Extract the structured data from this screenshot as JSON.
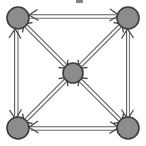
{
  "diagram": {
    "type": "directed-graph",
    "canvas": {
      "width": 146,
      "height": 146,
      "background": "#ffffff"
    },
    "style": {
      "node_fill": "#8c8c8c",
      "node_stroke": "#3c3c3c",
      "edge_color": "#5a5a5a",
      "edge_highlight": "#9a9a9a",
      "arrow_color": "#4a4a4a",
      "artifact_color": "#6e6e6e",
      "edge_rendering": "double-line",
      "edge_width": 1.1,
      "edge_gap": 2.2,
      "arrow_length": 7.5,
      "arrow_spread": 26
    },
    "nodes": [
      {
        "id": "n-top-left",
        "label": "",
        "cx": 18,
        "cy": 18,
        "r": 11.0
      },
      {
        "id": "n-top-right",
        "label": "",
        "cx": 128,
        "cy": 18,
        "r": 11.0
      },
      {
        "id": "n-center",
        "label": "",
        "cx": 73,
        "cy": 73,
        "r": 10.0
      },
      {
        "id": "n-bottom-left",
        "label": "",
        "cx": 18,
        "cy": 128,
        "r": 11.0
      },
      {
        "id": "n-bottom-right",
        "label": "",
        "cx": 128,
        "cy": 128,
        "r": 11.0
      }
    ],
    "edges": [
      {
        "id": "e-top",
        "from": "n-top-left",
        "to": "n-top-right",
        "directed": "both",
        "kind": "perimeter"
      },
      {
        "id": "e-left",
        "from": "n-top-left",
        "to": "n-bottom-left",
        "directed": "both",
        "kind": "perimeter"
      },
      {
        "id": "e-right",
        "from": "n-top-right",
        "to": "n-bottom-right",
        "directed": "both",
        "kind": "perimeter"
      },
      {
        "id": "e-bottom",
        "from": "n-bottom-left",
        "to": "n-bottom-right",
        "directed": "both",
        "kind": "perimeter"
      },
      {
        "id": "e-diag-tl",
        "from": "n-top-left",
        "to": "n-center",
        "directed": "both",
        "kind": "diagonal"
      },
      {
        "id": "e-diag-tr",
        "from": "n-top-right",
        "to": "n-center",
        "directed": "both",
        "kind": "diagonal"
      },
      {
        "id": "e-diag-bl",
        "from": "n-bottom-left",
        "to": "n-center",
        "directed": "both",
        "kind": "diagonal"
      },
      {
        "id": "e-diag-br",
        "from": "n-bottom-right",
        "to": "n-center",
        "directed": "both",
        "kind": "diagonal"
      }
    ],
    "artifact": {
      "present": true,
      "x": 76,
      "y": 0,
      "width": 7,
      "height": 3
    }
  }
}
